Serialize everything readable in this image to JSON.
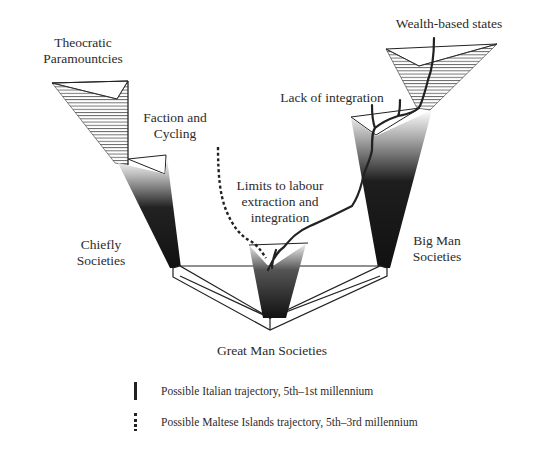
{
  "diagram": {
    "labels": {
      "theocratic": [
        "Theocratic",
        "Paramountcies"
      ],
      "faction": [
        "Faction and",
        "Cycling"
      ],
      "wealth": "Wealth-based states",
      "lack": "Lack of integration",
      "limits": [
        "Limits to labour",
        "extraction and",
        "integration"
      ],
      "chiefly": [
        "Chiefly",
        "Societies"
      ],
      "bigman": [
        "Big Man",
        "Societies"
      ],
      "greatman": "Great Man Societies"
    },
    "legend": [
      {
        "style": "solid",
        "text": "Possible Italian trajectory, 5th–1st millennium"
      },
      {
        "style": "dashed",
        "text": "Possible Maltese Islands trajectory, 5th–3rd millennium"
      }
    ],
    "colors": {
      "ink": "#222222",
      "background": "#ffffff"
    }
  }
}
